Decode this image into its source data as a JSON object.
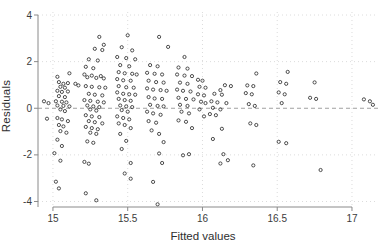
{
  "chart_data": {
    "type": "scatter",
    "title": "",
    "xlabel": "Fitted values",
    "ylabel": "Residuals",
    "x_ticks": [
      15,
      15.5,
      16,
      16.5,
      17
    ],
    "x_tick_labels": [
      "15",
      "15.5",
      "16",
      "16.5",
      "17"
    ],
    "y_ticks": [
      -4,
      -2,
      0,
      2,
      4
    ],
    "y_tick_labels": [
      "-4",
      "-2",
      "0",
      "2",
      "4"
    ],
    "xlim": [
      14.9,
      17.174
    ],
    "ylim": [
      -4.236,
      4.129
    ],
    "grid": "dotted light-gray gridlines at every x and y tick",
    "legend": "none",
    "ref_line_y": 0,
    "marker": "open-circle",
    "colors": {
      "marker_stroke": "#3a3a3a",
      "axis": "#8a8a8a",
      "grid": "#dcdcdc",
      "zero_line": "#a0a0a0",
      "text": "#3c3c3c"
    },
    "points": [
      [
        14.94,
        0.3
      ],
      [
        14.97,
        0.22
      ],
      [
        14.96,
        -0.45
      ],
      [
        15.03,
        1.35
      ],
      [
        15.11,
        1.5
      ],
      [
        15.04,
        1.12
      ],
      [
        15.07,
        1.05
      ],
      [
        15.1,
        1.08
      ],
      [
        15.05,
        0.92
      ],
      [
        15.08,
        0.88
      ],
      [
        15.03,
        0.75
      ],
      [
        15.06,
        0.7
      ],
      [
        15.1,
        0.72
      ],
      [
        15.04,
        0.52
      ],
      [
        15.08,
        0.48
      ],
      [
        15.02,
        0.3
      ],
      [
        15.06,
        0.28
      ],
      [
        15.09,
        0.25
      ],
      [
        15.03,
        0.12
      ],
      [
        15.07,
        0.1
      ],
      [
        15.11,
        0.08
      ],
      [
        15.05,
        -0.05
      ],
      [
        15.08,
        -0.12
      ],
      [
        15.03,
        -0.42
      ],
      [
        15.06,
        -0.48
      ],
      [
        15.1,
        -0.55
      ],
      [
        15.04,
        -0.72
      ],
      [
        15.07,
        -0.78
      ],
      [
        15.05,
        -0.98
      ],
      [
        15.09,
        -1.05
      ],
      [
        15.03,
        -1.35
      ],
      [
        15.06,
        -1.62
      ],
      [
        15.01,
        -1.93
      ],
      [
        15.05,
        -2.25
      ],
      [
        15.02,
        -3.15
      ],
      [
        15.04,
        -3.44
      ],
      [
        15.15,
        1.05
      ],
      [
        15.17,
        0.98
      ],
      [
        15.31,
        3.06
      ],
      [
        15.34,
        2.72
      ],
      [
        15.28,
        2.55
      ],
      [
        15.33,
        2.5
      ],
      [
        15.24,
        2.1
      ],
      [
        15.3,
        2.05
      ],
      [
        15.22,
        1.78
      ],
      [
        15.27,
        1.72
      ],
      [
        15.21,
        1.45
      ],
      [
        15.26,
        1.4
      ],
      [
        15.32,
        1.38
      ],
      [
        15.23,
        1.33
      ],
      [
        15.29,
        1.3
      ],
      [
        15.34,
        1.28
      ],
      [
        15.22,
        0.95
      ],
      [
        15.26,
        0.92
      ],
      [
        15.31,
        0.9
      ],
      [
        15.35,
        0.88
      ],
      [
        15.24,
        0.62
      ],
      [
        15.28,
        0.58
      ],
      [
        15.33,
        0.55
      ],
      [
        15.21,
        0.35
      ],
      [
        15.25,
        0.32
      ],
      [
        15.3,
        0.28
      ],
      [
        15.34,
        0.25
      ],
      [
        15.23,
        0.12
      ],
      [
        15.27,
        0.08
      ],
      [
        15.31,
        0.05
      ],
      [
        15.25,
        -0.05
      ],
      [
        15.29,
        -0.1
      ],
      [
        15.22,
        -0.3
      ],
      [
        15.26,
        -0.35
      ],
      [
        15.31,
        -0.38
      ],
      [
        15.24,
        -0.55
      ],
      [
        15.28,
        -0.6
      ],
      [
        15.33,
        -0.65
      ],
      [
        15.22,
        -0.8
      ],
      [
        15.26,
        -0.85
      ],
      [
        15.3,
        -0.9
      ],
      [
        15.25,
        -1.05
      ],
      [
        15.29,
        -1.1
      ],
      [
        15.23,
        -1.42
      ],
      [
        15.27,
        -1.48
      ],
      [
        15.21,
        -2.3
      ],
      [
        15.24,
        -2.38
      ],
      [
        15.22,
        -3.65
      ],
      [
        15.29,
        -3.95
      ],
      [
        15.5,
        3.13
      ],
      [
        15.46,
        2.62
      ],
      [
        15.53,
        2.48
      ],
      [
        15.43,
        2.2
      ],
      [
        15.49,
        2.15
      ],
      [
        15.55,
        2.1
      ],
      [
        15.45,
        1.85
      ],
      [
        15.51,
        1.8
      ],
      [
        15.44,
        1.55
      ],
      [
        15.48,
        1.5
      ],
      [
        15.53,
        1.48
      ],
      [
        15.56,
        1.45
      ],
      [
        15.43,
        1.25
      ],
      [
        15.47,
        1.2
      ],
      [
        15.52,
        1.18
      ],
      [
        15.44,
        0.95
      ],
      [
        15.49,
        0.9
      ],
      [
        15.54,
        0.88
      ],
      [
        15.43,
        0.68
      ],
      [
        15.47,
        0.62
      ],
      [
        15.51,
        0.6
      ],
      [
        15.55,
        0.58
      ],
      [
        15.44,
        0.4
      ],
      [
        15.48,
        0.35
      ],
      [
        15.52,
        0.32
      ],
      [
        15.45,
        0.12
      ],
      [
        15.49,
        0.08
      ],
      [
        15.53,
        0.05
      ],
      [
        15.46,
        -0.08
      ],
      [
        15.5,
        -0.15
      ],
      [
        15.43,
        -0.35
      ],
      [
        15.47,
        -0.42
      ],
      [
        15.51,
        -0.48
      ],
      [
        15.44,
        -0.65
      ],
      [
        15.48,
        -0.72
      ],
      [
        15.52,
        -0.85
      ],
      [
        15.45,
        -1.1
      ],
      [
        15.49,
        -1.4
      ],
      [
        15.46,
        -1.75
      ],
      [
        15.52,
        -2.35
      ],
      [
        15.48,
        -2.8
      ],
      [
        15.52,
        -3.02
      ],
      [
        15.71,
        3.06
      ],
      [
        15.77,
        2.63
      ],
      [
        15.65,
        1.85
      ],
      [
        15.7,
        1.8
      ],
      [
        15.63,
        1.52
      ],
      [
        15.68,
        1.48
      ],
      [
        15.73,
        1.45
      ],
      [
        15.64,
        1.18
      ],
      [
        15.69,
        1.12
      ],
      [
        15.74,
        1.1
      ],
      [
        15.63,
        0.85
      ],
      [
        15.67,
        0.8
      ],
      [
        15.72,
        0.78
      ],
      [
        15.76,
        0.75
      ],
      [
        15.64,
        0.48
      ],
      [
        15.68,
        0.42
      ],
      [
        15.73,
        0.4
      ],
      [
        15.65,
        0.15
      ],
      [
        15.7,
        0.1
      ],
      [
        15.74,
        0.08
      ],
      [
        15.63,
        -0.15
      ],
      [
        15.67,
        -0.22
      ],
      [
        15.72,
        -0.28
      ],
      [
        15.64,
        -0.55
      ],
      [
        15.69,
        -0.62
      ],
      [
        15.66,
        -0.95
      ],
      [
        15.71,
        -1.1
      ],
      [
        15.74,
        -1.45
      ],
      [
        15.71,
        -1.94
      ],
      [
        15.73,
        -2.35
      ],
      [
        15.67,
        -3.16
      ],
      [
        15.7,
        -4.12
      ],
      [
        15.88,
        2.2
      ],
      [
        15.84,
        1.75
      ],
      [
        15.9,
        1.7
      ],
      [
        15.83,
        1.45
      ],
      [
        15.88,
        1.4
      ],
      [
        15.93,
        1.38
      ],
      [
        15.85,
        1.1
      ],
      [
        15.9,
        1.05
      ],
      [
        15.83,
        0.8
      ],
      [
        15.87,
        0.75
      ],
      [
        15.92,
        0.72
      ],
      [
        15.84,
        0.45
      ],
      [
        15.89,
        0.4
      ],
      [
        15.94,
        0.38
      ],
      [
        15.85,
        0.15
      ],
      [
        15.9,
        0.1
      ],
      [
        15.86,
        -0.15
      ],
      [
        15.91,
        -0.22
      ],
      [
        15.84,
        -0.52
      ],
      [
        15.89,
        -0.58
      ],
      [
        15.93,
        -0.85
      ],
      [
        15.87,
        -2.02
      ],
      [
        15.91,
        -1.97
      ],
      [
        15.97,
        1.22
      ],
      [
        16.0,
        1.18
      ],
      [
        15.98,
        0.92
      ],
      [
        16.02,
        0.88
      ],
      [
        15.97,
        0.6
      ],
      [
        16.01,
        0.55
      ],
      [
        15.99,
        0.28
      ],
      [
        16.02,
        0.22
      ],
      [
        15.98,
        -0.05
      ],
      [
        16.01,
        -0.35
      ],
      [
        16.15,
        0.99
      ],
      [
        16.19,
        0.95
      ],
      [
        16.12,
        0.78
      ],
      [
        16.08,
        0.62
      ],
      [
        16.13,
        0.58
      ],
      [
        16.06,
        0.3
      ],
      [
        16.1,
        0.25
      ],
      [
        16.16,
        0.22
      ],
      [
        16.07,
        0.02
      ],
      [
        16.12,
        -0.05
      ],
      [
        16.05,
        -0.25
      ],
      [
        16.09,
        -0.3
      ],
      [
        16.13,
        -0.88
      ],
      [
        16.07,
        -1.32
      ],
      [
        16.12,
        -2.37
      ],
      [
        16.14,
        -1.97
      ],
      [
        16.17,
        -2.23
      ],
      [
        16.36,
        1.49
      ],
      [
        16.3,
        0.98
      ],
      [
        16.34,
        0.95
      ],
      [
        16.29,
        0.65
      ],
      [
        16.33,
        0.6
      ],
      [
        16.31,
        0.18
      ],
      [
        16.35,
        0.1
      ],
      [
        16.32,
        -0.65
      ],
      [
        16.36,
        -0.72
      ],
      [
        16.34,
        -2.45
      ],
      [
        16.57,
        1.56
      ],
      [
        16.52,
        1.12
      ],
      [
        16.56,
        1.05
      ],
      [
        16.51,
        0.68
      ],
      [
        16.55,
        0.6
      ],
      [
        16.53,
        0.22
      ],
      [
        16.51,
        -1.44
      ],
      [
        16.56,
        -1.5
      ],
      [
        16.75,
        1.11
      ],
      [
        16.72,
        0.45
      ],
      [
        16.76,
        0.4
      ],
      [
        16.79,
        -2.65
      ],
      [
        17.08,
        0.38
      ],
      [
        17.12,
        0.3
      ],
      [
        17.14,
        0.15
      ]
    ]
  }
}
